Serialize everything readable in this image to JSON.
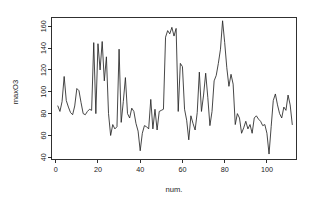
{
  "chart_data": {
    "type": "line",
    "title": "",
    "subtitle": "",
    "xlabel": "num.",
    "ylabel": "maxO3",
    "xlim": [
      -2,
      114
    ],
    "ylim": [
      38,
      168
    ],
    "grid": false,
    "legend": null,
    "legend_position": "none",
    "x_ticks": [
      0,
      20,
      40,
      60,
      80,
      100
    ],
    "y_ticks": [
      40,
      60,
      80,
      100,
      120,
      140,
      160
    ],
    "x_tick_labels": [
      "0",
      "20",
      "40",
      "60",
      "80",
      "100"
    ],
    "y_tick_labels": [
      "40",
      "60",
      "80",
      "100",
      "120",
      "140",
      "160"
    ],
    "series": [
      {
        "name": "maxO3",
        "color": "#262626",
        "x": [
          1,
          2,
          3,
          4,
          5,
          6,
          7,
          8,
          9,
          10,
          11,
          12,
          13,
          14,
          15,
          16,
          17,
          18,
          19,
          20,
          21,
          22,
          23,
          24,
          25,
          26,
          27,
          28,
          29,
          30,
          31,
          32,
          33,
          34,
          35,
          36,
          37,
          38,
          39,
          40,
          41,
          42,
          43,
          44,
          45,
          46,
          47,
          48,
          49,
          50,
          51,
          52,
          53,
          54,
          55,
          56,
          57,
          58,
          59,
          60,
          61,
          62,
          63,
          64,
          65,
          66,
          67,
          68,
          69,
          70,
          71,
          72,
          73,
          74,
          75,
          76,
          77,
          78,
          79,
          80,
          81,
          82,
          83,
          84,
          85,
          86,
          87,
          88,
          89,
          90,
          91,
          92,
          93,
          94,
          95,
          96,
          97,
          98,
          99,
          100,
          101,
          102,
          103,
          104,
          105,
          106,
          107,
          108,
          109,
          110,
          111,
          112
        ],
        "values": [
          87,
          82,
          91,
          114,
          92,
          86,
          81,
          79,
          87,
          103,
          101,
          90,
          80,
          79,
          82,
          84,
          83,
          145,
          80,
          144,
          120,
          146,
          110,
          132,
          80,
          60,
          70,
          66,
          68,
          139,
          72,
          91,
          113,
          80,
          76,
          85,
          82,
          71,
          64,
          46,
          62,
          69,
          68,
          66,
          93,
          66,
          84,
          65,
          82,
          83,
          84,
          150,
          156,
          153,
          159,
          151,
          158,
          82,
          126,
          123,
          84,
          74,
          56,
          78,
          71,
          65,
          81,
          118,
          82,
          97,
          117,
          95,
          69,
          82,
          110,
          115,
          126,
          139,
          165,
          145,
          122,
          105,
          116,
          107,
          70,
          80,
          76,
          62,
          67,
          73,
          66,
          70,
          62,
          76,
          78,
          75,
          73,
          69,
          70,
          62,
          43,
          68,
          92,
          98,
          88,
          80,
          76,
          86,
          83,
          97,
          88,
          70
        ]
      }
    ]
  },
  "axes": {
    "y_title": "maxO3",
    "x_title": "num."
  },
  "icons": {
    "none": ""
  }
}
